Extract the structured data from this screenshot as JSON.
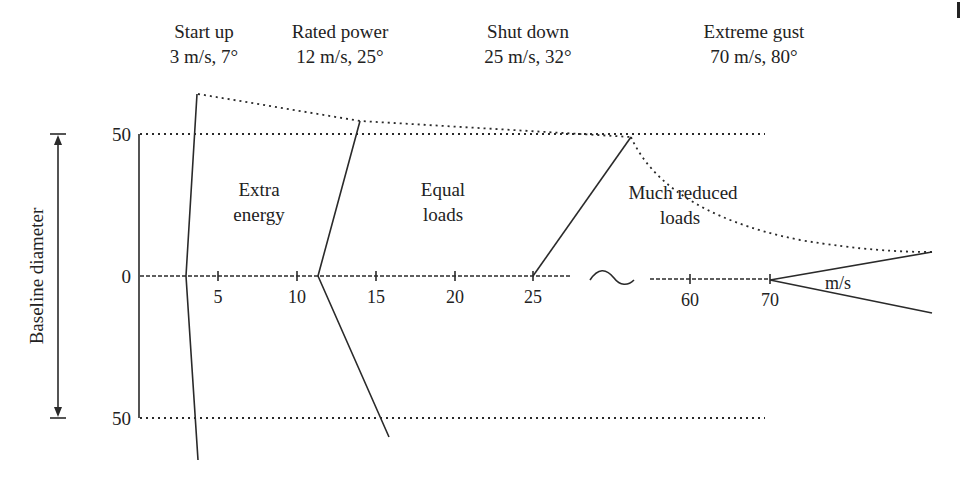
{
  "headers": [
    {
      "title": "Start up",
      "detail": "3 m/s, 7°"
    },
    {
      "title": "Rated power",
      "detail": "12 m/s, 25°"
    },
    {
      "title": "Shut down",
      "detail": "25 m/s, 32°"
    },
    {
      "title": "Extreme gust",
      "detail": "70 m/s, 80°"
    }
  ],
  "regions": [
    {
      "line1": "Extra",
      "line2": "energy"
    },
    {
      "line1": "Equal",
      "line2": "loads"
    },
    {
      "line1": "Much reduced",
      "line2": "loads"
    }
  ],
  "y_axis": {
    "label": "Baseline diameter",
    "ticks": [
      "50",
      "0",
      "50"
    ]
  },
  "x_axis": {
    "ticks": [
      "5",
      "10",
      "15",
      "20",
      "25",
      "60",
      "70"
    ],
    "break_symbol": "~",
    "unit_label": "m/s"
  },
  "colors": {
    "line": "#2a2a2a",
    "text": "#222222",
    "background": "#ffffff"
  }
}
